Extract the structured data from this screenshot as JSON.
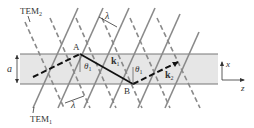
{
  "diagram": {
    "labels": {
      "tem2": "TEM",
      "tem2_sub": "2",
      "tem1": "TEM",
      "tem1_sub": "1",
      "lambda_top": "λ",
      "lambda_bottom": "λ",
      "point_a": "A",
      "point_b": "B",
      "theta1_a": "θ",
      "theta1_a_sub": "1",
      "theta1_b": "θ",
      "theta1_b_sub": "1",
      "k1": "k",
      "k1_sub": "1",
      "k2": "k",
      "k2_sub": "2",
      "thickness": "a",
      "axis_x": "x",
      "axis_z": "z"
    },
    "colors": {
      "band": "#e6e6e6",
      "band_edge": "#777777",
      "wavefront": "#8a8a8a",
      "ray": "#111111"
    }
  }
}
